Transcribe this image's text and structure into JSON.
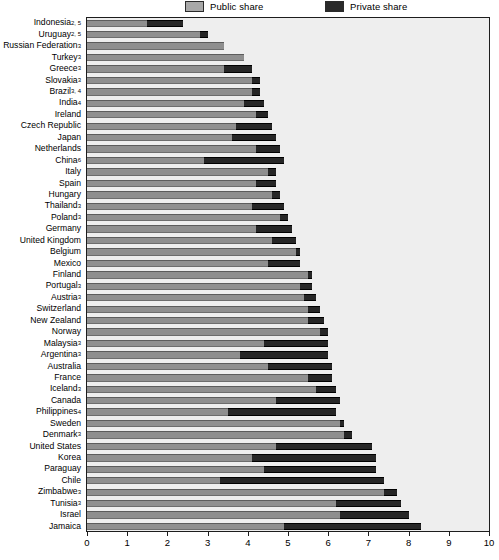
{
  "legend": {
    "public_label": "Public share",
    "private_label": "Private share",
    "public_color": "#8f8f8f",
    "private_color": "#262626",
    "position": "top"
  },
  "axis": {
    "x_ticks": [
      "0",
      "1",
      "2",
      "3",
      "4",
      "5",
      "6",
      "7",
      "8",
      "9",
      "10"
    ],
    "xlim": [
      0,
      10
    ]
  },
  "chart_data": {
    "type": "bar",
    "orientation": "horizontal",
    "stacked": true,
    "title": "",
    "subtitle": "",
    "xlabel": "",
    "ylabel": "",
    "xlim": [
      0,
      10
    ],
    "ylim": null,
    "grid": false,
    "legend_position": "top",
    "legend": [
      "Public share",
      "Private share"
    ],
    "categories": [
      "Indonesia2, 5",
      "Uruguay2, 5",
      "Russian Federation3",
      "Turkey3",
      "Greece3",
      "Slovakia3",
      "Brazil3, 4",
      "India4",
      "Ireland",
      "Czech Republic",
      "Japan",
      "Netherlands",
      "China6",
      "Italy",
      "Spain",
      "Hungary",
      "Thailand3",
      "Poland3",
      "Germany",
      "United Kingdom",
      "Belgium",
      "Mexico",
      "Finland",
      "Portugal3",
      "Austria3",
      "Switzerland",
      "New Zealand",
      "Norway",
      "Malaysia3",
      "Argentina3",
      "Australia",
      "France",
      "Iceland3",
      "Canada",
      "Philippines4",
      "Sweden",
      "Denmark3",
      "United States",
      "Korea",
      "Paraguay",
      "Chile",
      "Zimbabwe3",
      "Tunisia3",
      "Israel",
      "Jamaica"
    ],
    "series": [
      {
        "name": "Public share",
        "values": [
          1.5,
          2.8,
          3.4,
          3.9,
          3.4,
          4.1,
          4.1,
          3.9,
          4.2,
          3.7,
          3.6,
          4.2,
          2.9,
          4.5,
          4.2,
          4.6,
          4.1,
          4.8,
          4.2,
          4.6,
          5.2,
          4.5,
          5.5,
          5.3,
          5.4,
          5.5,
          5.5,
          5.8,
          4.4,
          3.8,
          4.5,
          5.5,
          5.7,
          4.7,
          3.5,
          6.3,
          6.4,
          4.7,
          4.1,
          4.4,
          3.3,
          7.4,
          6.2,
          6.3,
          4.9
        ]
      },
      {
        "name": "Private share",
        "values": [
          0.9,
          0.2,
          0.0,
          0.0,
          0.7,
          0.2,
          0.2,
          0.5,
          0.3,
          0.9,
          1.1,
          0.6,
          2.0,
          0.2,
          0.5,
          0.2,
          0.8,
          0.2,
          0.9,
          0.6,
          0.1,
          0.8,
          0.1,
          0.3,
          0.3,
          0.3,
          0.4,
          0.2,
          1.6,
          2.2,
          1.6,
          0.6,
          0.5,
          1.6,
          2.7,
          0.1,
          0.2,
          2.4,
          3.1,
          2.8,
          4.1,
          0.3,
          1.6,
          1.7,
          3.4
        ]
      }
    ],
    "totals": [
      2.4,
      3.0,
      3.4,
      3.9,
      4.1,
      4.3,
      4.3,
      4.4,
      4.5,
      4.6,
      4.7,
      4.8,
      4.9,
      4.7,
      4.7,
      4.8,
      4.9,
      5.0,
      5.1,
      5.2,
      5.3,
      5.3,
      5.6,
      5.6,
      5.7,
      5.8,
      5.9,
      6.0,
      6.0,
      6.0,
      6.1,
      6.1,
      6.2,
      6.3,
      6.2,
      6.4,
      6.6,
      7.1,
      7.2,
      7.2,
      7.4,
      7.7,
      7.8,
      8.0,
      8.3
    ]
  }
}
